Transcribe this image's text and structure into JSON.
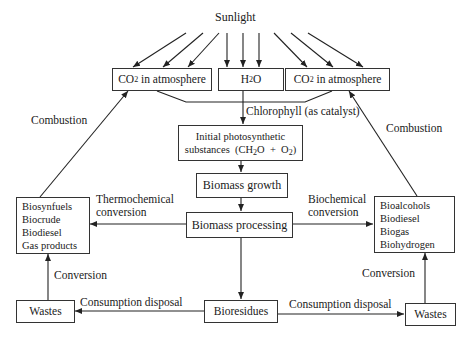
{
  "diagram": {
    "top_label": "Sunlight",
    "nodes": {
      "co2_left": {
        "prefix": "CO",
        "sub": "2",
        "suffix": " in atmosphere"
      },
      "h2o": {
        "prefix": "H",
        "sub": "2",
        "suffix": "O"
      },
      "co2_right": {
        "prefix": "CO",
        "sub": "2",
        "suffix": " in atmosphere"
      },
      "initial": {
        "line1": "Initial photosynthetic",
        "line2_prefix": "substances  (CH",
        "line2_sub": "2",
        "line2_mid": "O  +  O",
        "line2_sub2": "2",
        "line2_suffix": ")"
      },
      "growth": "Biomass growth",
      "processing": "Biomass processing",
      "thermo_products": [
        "Biosynfuels",
        "Biocrude",
        "Biodiesel",
        "Gas products"
      ],
      "bio_products": [
        "Bioalcohols",
        "Biodiesel",
        "Biogas",
        "Biohydrogen"
      ],
      "bioresidues": "Bioresidues",
      "wastes_left": "Wastes",
      "wastes_right": "Wastes"
    },
    "edge_labels": {
      "chlorophyll": "Chlorophyll (as catalyst)",
      "combustion_left": "Combustion",
      "combustion_right": "Combustion",
      "thermo_line1": "Thermochemical",
      "thermo_line2": "conversion",
      "bio_line1": "Biochemical",
      "bio_line2": "conversion",
      "conversion_left": "Conversion",
      "conversion_right": "Conversion",
      "disposal_left": "Consumption disposal",
      "disposal_right": "Consumption disposal"
    },
    "colors": {
      "stroke": "#222222",
      "background": "#ffffff"
    }
  }
}
